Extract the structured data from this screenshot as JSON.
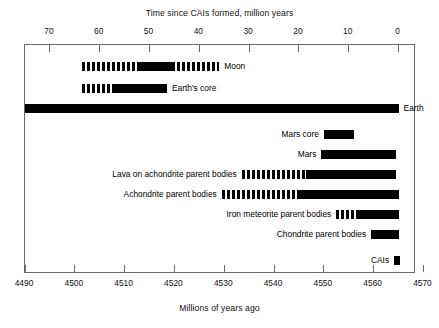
{
  "chart_data": {
    "type": "bar",
    "orientation": "horizontal",
    "title": "",
    "top_axis": {
      "label": "Time since CAIs formed, million years",
      "ticks": [
        70,
        60,
        50,
        40,
        30,
        20,
        10,
        0
      ],
      "range": [
        75,
        -3.5
      ],
      "direction": "descending"
    },
    "bottom_axis": {
      "label": "Millions of years ago",
      "ticks": [
        4490,
        4500,
        4510,
        4520,
        4530,
        4540,
        4550,
        4560,
        4570
      ],
      "range": [
        4490,
        4570
      ],
      "direction": "ascending"
    },
    "grid": false,
    "legend": null,
    "units": "million years before/after CAI formation",
    "series": [
      {
        "name": "Moon",
        "label": "Moon",
        "label_side": "right",
        "segments": [
          {
            "style": "dashed",
            "start_myr": 63.5,
            "end_myr": 52.0
          },
          {
            "style": "solid",
            "start_myr": 52.0,
            "end_myr": 45.5
          },
          {
            "style": "dashed",
            "start_myr": 45.5,
            "end_myr": 36.0
          }
        ]
      },
      {
        "name": "Earth's core",
        "label": "Earth's core",
        "label_side": "right",
        "segments": [
          {
            "style": "dashed",
            "start_myr": 63.5,
            "end_myr": 57.5
          },
          {
            "style": "solid",
            "start_myr": 57.5,
            "end_myr": 46.5
          }
        ]
      },
      {
        "name": "Earth",
        "label": "Earth",
        "label_side": "right",
        "segments": [
          {
            "style": "solid",
            "start_myr": 75.0,
            "end_myr": 0.0
          }
        ]
      },
      {
        "name": "Mars core",
        "label": "Mars core",
        "label_side": "left",
        "segments": [
          {
            "style": "solid",
            "start_myr": 15.0,
            "end_myr": 9.0
          }
        ]
      },
      {
        "name": "Mars",
        "label": "Mars",
        "label_side": "left",
        "segments": [
          {
            "style": "solid",
            "start_myr": 15.5,
            "end_myr": 0.5
          }
        ]
      },
      {
        "name": "Lava on achondrite parent bodies",
        "label": "Lava on achondrite parent bodies",
        "label_side": "left",
        "segments": [
          {
            "style": "dashed",
            "start_myr": 31.5,
            "end_myr": 18.5
          },
          {
            "style": "solid",
            "start_myr": 18.5,
            "end_myr": 0.5
          }
        ]
      },
      {
        "name": "Achondrite parent bodies",
        "label": "Achondrite parent bodies",
        "label_side": "left",
        "segments": [
          {
            "style": "dashed",
            "start_myr": 35.5,
            "end_myr": 20.0
          },
          {
            "style": "solid",
            "start_myr": 20.0,
            "end_myr": 0.0
          }
        ]
      },
      {
        "name": "Iron meteorite parent bodies",
        "label": "Iron meteorite parent bodies",
        "label_side": "left",
        "segments": [
          {
            "style": "dashed",
            "start_myr": 12.5,
            "end_myr": 8.5
          },
          {
            "style": "solid",
            "start_myr": 8.5,
            "end_myr": 0.0
          }
        ]
      },
      {
        "name": "Chondrite parent bodies",
        "label": "Chondrite parent bodies",
        "label_side": "left",
        "segments": [
          {
            "style": "solid",
            "start_myr": 5.5,
            "end_myr": 0.0
          }
        ]
      },
      {
        "name": "CAIs",
        "label": "CAIs",
        "label_side": "left",
        "segments": [
          {
            "style": "solid",
            "start_myr": 0.9,
            "end_myr": -0.3
          }
        ]
      }
    ]
  }
}
